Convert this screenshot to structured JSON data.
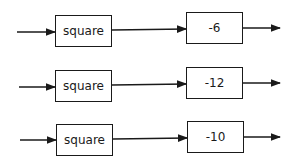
{
  "diagram": {
    "type": "block-diagram",
    "rows": [
      {
        "function_block": "square",
        "gain_block": "-6"
      },
      {
        "function_block": "square",
        "gain_block": "-12"
      },
      {
        "function_block": "square",
        "gain_block": "-10"
      }
    ]
  }
}
